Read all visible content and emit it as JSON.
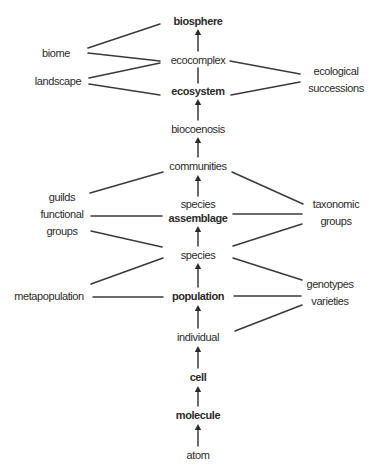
{
  "diagram": {
    "type": "hierarchy-of-levels-of-organization",
    "central_axis": [
      {
        "id": "biosphere",
        "label": "biosphere",
        "bold": true
      },
      {
        "id": "ecocomplex",
        "label": "ecocomplex",
        "bold": false
      },
      {
        "id": "ecosystem",
        "label": "ecosystem",
        "bold": true
      },
      {
        "id": "biocoenosis",
        "label": "biocoenosis",
        "bold": false
      },
      {
        "id": "communities",
        "label": "communities",
        "bold": false
      },
      {
        "id": "species_assemblage",
        "label_lines": [
          "species",
          "assemblage"
        ],
        "bold": true
      },
      {
        "id": "species",
        "label": "species",
        "bold": false
      },
      {
        "id": "population",
        "label": "population",
        "bold": true
      },
      {
        "id": "individual",
        "label": "individual",
        "bold": false
      },
      {
        "id": "cell",
        "label": "cell",
        "bold": true
      },
      {
        "id": "molecule",
        "label": "molecule",
        "bold": true
      },
      {
        "id": "atom",
        "label": "atom",
        "bold": false
      }
    ],
    "left_nodes": [
      {
        "id": "biome",
        "label_lines": [
          "biome"
        ]
      },
      {
        "id": "landscape",
        "label_lines": [
          "landscape"
        ]
      },
      {
        "id": "guilds",
        "label_lines": [
          "guilds",
          "functional",
          "groups"
        ]
      },
      {
        "id": "metapopulation",
        "label_lines": [
          "metapopulation"
        ]
      }
    ],
    "right_nodes": [
      {
        "id": "ecological_successions",
        "label_lines": [
          "ecological",
          "successions"
        ]
      },
      {
        "id": "taxonomic_groups",
        "label_lines": [
          "taxonomic",
          "groups"
        ]
      },
      {
        "id": "genotypes",
        "label_lines": [
          "genotypes",
          "varieties"
        ]
      }
    ],
    "arrows": [
      {
        "from": "ecosystem",
        "to": "biocoenosis",
        "direction": "up",
        "note": "arrow from biocoenosis up to ecosystem"
      },
      {
        "from": "atom",
        "to": "molecule"
      },
      {
        "from": "molecule",
        "to": "cell"
      },
      {
        "from": "cell",
        "to": "individual"
      },
      {
        "from": "individual",
        "to": "population"
      },
      {
        "from": "population",
        "to": "species"
      },
      {
        "from": "species",
        "to": "species_assemblage"
      },
      {
        "from": "species_assemblage",
        "to": "communities"
      },
      {
        "from": "communities",
        "to": "biocoenosis"
      },
      {
        "from": "biocoenosis",
        "to": "ecosystem"
      },
      {
        "from": "ecocomplex",
        "to": "biosphere"
      }
    ],
    "plain_links": [
      {
        "a": "ecosystem",
        "b": "ecocomplex"
      },
      {
        "a": "biome",
        "b": "biosphere"
      },
      {
        "a": "biome",
        "b": "ecocomplex"
      },
      {
        "a": "landscape",
        "b": "ecocomplex"
      },
      {
        "a": "landscape",
        "b": "ecosystem"
      },
      {
        "a": "ecological_successions",
        "b": "ecocomplex"
      },
      {
        "a": "ecological_successions",
        "b": "ecosystem"
      },
      {
        "a": "guilds",
        "b": "communities"
      },
      {
        "a": "guilds",
        "b": "species_assemblage"
      },
      {
        "a": "guilds",
        "b": "species"
      },
      {
        "a": "taxonomic_groups",
        "b": "communities"
      },
      {
        "a": "taxonomic_groups",
        "b": "species_assemblage"
      },
      {
        "a": "taxonomic_groups",
        "b": "species"
      },
      {
        "a": "metapopulation",
        "b": "species"
      },
      {
        "a": "metapopulation",
        "b": "population"
      },
      {
        "a": "genotypes",
        "b": "species"
      },
      {
        "a": "genotypes",
        "b": "population"
      },
      {
        "a": "genotypes",
        "b": "individual"
      }
    ]
  }
}
